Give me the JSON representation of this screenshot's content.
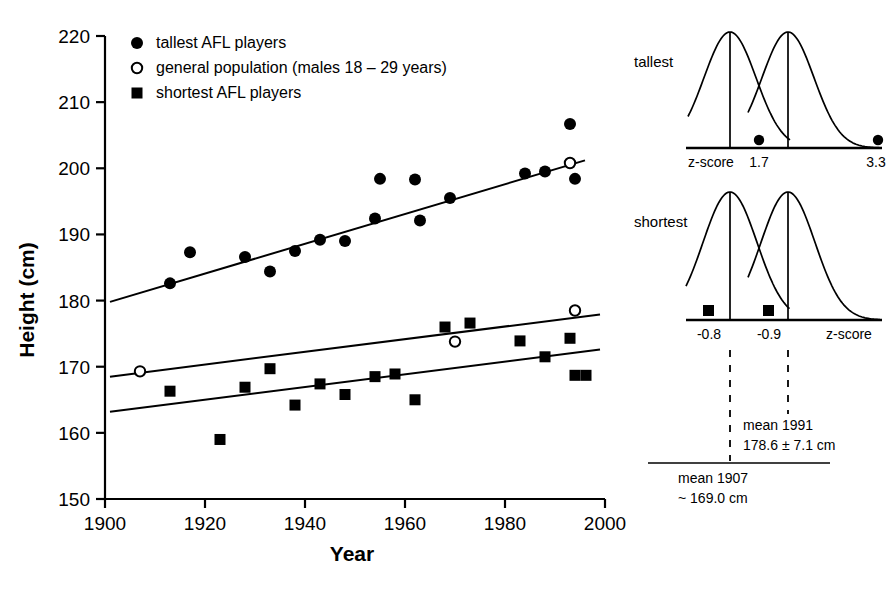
{
  "chart_data": {
    "type": "scatter",
    "title": "",
    "xlabel": "Year",
    "ylabel": "Height (cm)",
    "xlim": [
      1900,
      2000
    ],
    "ylim": [
      150,
      220
    ],
    "xticks": [
      1900,
      1920,
      1940,
      1960,
      1980,
      2000
    ],
    "yticks": [
      150,
      160,
      170,
      180,
      190,
      200,
      210,
      220
    ],
    "grid": false,
    "legend_position": "top-left",
    "series": [
      {
        "name": "tallest AFL players",
        "marker": "filled-circle",
        "points": [
          [
            1913,
            182.6
          ],
          [
            1917,
            187.3
          ],
          [
            1928,
            186.6
          ],
          [
            1933,
            184.4
          ],
          [
            1938,
            187.5
          ],
          [
            1943,
            189.2
          ],
          [
            1948,
            189.0
          ],
          [
            1954,
            192.4
          ],
          [
            1955,
            198.4
          ],
          [
            1962,
            198.3
          ],
          [
            1963,
            192.1
          ],
          [
            1969,
            195.5
          ],
          [
            1984,
            199.2
          ],
          [
            1988,
            199.5
          ],
          [
            1993,
            206.7
          ],
          [
            1994,
            198.4
          ]
        ]
      },
      {
        "name": "general population (males 18 – 29 years)",
        "marker": "open-circle",
        "points": [
          [
            1907,
            169.3
          ],
          [
            1970,
            173.8
          ],
          [
            1994,
            178.5
          ],
          [
            1993,
            200.8
          ]
        ]
      },
      {
        "name": "shortest AFL players",
        "marker": "filled-square",
        "points": [
          [
            1913,
            166.3
          ],
          [
            1923,
            159.0
          ],
          [
            1928,
            166.9
          ],
          [
            1933,
            169.7
          ],
          [
            1938,
            164.2
          ],
          [
            1943,
            167.4
          ],
          [
            1948,
            165.8
          ],
          [
            1954,
            168.5
          ],
          [
            1958,
            168.9
          ],
          [
            1962,
            165.0
          ],
          [
            1968,
            176.0
          ],
          [
            1973,
            176.6
          ],
          [
            1983,
            173.9
          ],
          [
            1988,
            171.5
          ],
          [
            1993,
            174.3
          ],
          [
            1994,
            168.7
          ]
        ]
      }
    ],
    "trend_lines": [
      {
        "name": "tallest-trend",
        "x": [
          1901,
          1996
        ],
        "y": [
          179.8,
          201.2
        ]
      },
      {
        "name": "general-population-trend",
        "x": [
          1901,
          1999
        ],
        "y": [
          168.5,
          177.9
        ]
      },
      {
        "name": "shortest-trend",
        "x": [
          1901,
          1999
        ],
        "y": [
          163.2,
          172.6
        ]
      }
    ]
  },
  "legend": {
    "items": [
      {
        "marker": "filled-circle",
        "label": "tallest AFL players"
      },
      {
        "marker": "open-circle",
        "label": "general population (males 18 – 29 years)"
      },
      {
        "marker": "filled-square",
        "label": "shortest AFL players"
      }
    ]
  },
  "axes": {
    "y_title": "Height (cm)",
    "x_title": "Year",
    "y_tick_labels": [
      "220",
      "210",
      "200",
      "190",
      "180",
      "170",
      "160",
      "150"
    ],
    "x_tick_labels": [
      "1900",
      "1920",
      "1940",
      "1960",
      "1980",
      "2000"
    ]
  },
  "panels": [
    {
      "id": "tallest-panel",
      "label": "tallest",
      "axis_label": "z-score",
      "axis_label_side": "left",
      "marker": "filled-circle",
      "markers": [
        {
          "value": "1.7",
          "z": 1.7
        },
        {
          "value": "3.3",
          "z": 3.3
        }
      ],
      "tick_values": [
        "1.7",
        "3.3"
      ]
    },
    {
      "id": "shortest-panel",
      "label": "shortest",
      "axis_label": "z-score",
      "axis_label_side": "right",
      "marker": "filled-square",
      "markers": [
        {
          "value": "-0.8",
          "z": -0.8
        },
        {
          "value": "-0.9",
          "z": -0.9
        }
      ],
      "tick_values": [
        "-0.8",
        "-0.9"
      ]
    }
  ],
  "annotations": {
    "mean_1991_line1": "mean 1991",
    "mean_1991_line2": "178.6 ± 7.1 cm",
    "mean_1907_line1": "mean 1907",
    "mean_1907_line2": "~ 169.0 cm"
  },
  "colors": {
    "ink": "#000000",
    "background": "#ffffff"
  }
}
